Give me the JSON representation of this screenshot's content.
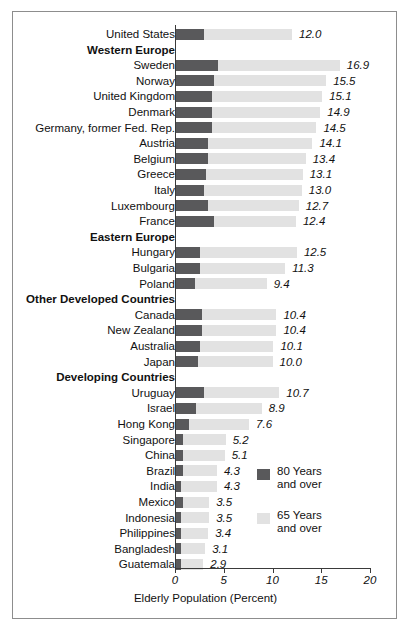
{
  "chart_data": {
    "type": "bar",
    "orientation": "horizontal",
    "stacked": true,
    "title": "",
    "xlabel": "Elderly Population (Percent)",
    "ylabel": "",
    "xlim": [
      0,
      20
    ],
    "xticks": [
      "0",
      "5",
      "10",
      "15",
      "20"
    ],
    "grid": false,
    "legend_position": "inside-right",
    "series": [
      {
        "name": "80 Years and over",
        "color": "#59595b"
      },
      {
        "name": "65 Years and over",
        "color": "#e2e2e2"
      }
    ],
    "rows": [
      {
        "kind": "item",
        "label": "United States",
        "value": 12.0,
        "value_label": "12.0",
        "sub80": 3.0
      },
      {
        "kind": "group",
        "label": "Western Europe",
        "value": null,
        "value_label": "",
        "sub80": null
      },
      {
        "kind": "item",
        "label": "Sweden",
        "value": 16.9,
        "value_label": "16.9",
        "sub80": 4.4
      },
      {
        "kind": "item",
        "label": "Norway",
        "value": 15.5,
        "value_label": "15.5",
        "sub80": 4.0
      },
      {
        "kind": "item",
        "label": "United Kingdom",
        "value": 15.1,
        "value_label": "15.1",
        "sub80": 3.8
      },
      {
        "kind": "item",
        "label": "Denmark",
        "value": 14.9,
        "value_label": "14.9",
        "sub80": 3.8
      },
      {
        "kind": "item",
        "label": "Germany, former Fed. Rep.",
        "value": 14.5,
        "value_label": "14.5",
        "sub80": 3.8
      },
      {
        "kind": "item",
        "label": "Austria",
        "value": 14.1,
        "value_label": "14.1",
        "sub80": 3.4
      },
      {
        "kind": "item",
        "label": "Belgium",
        "value": 13.4,
        "value_label": "13.4",
        "sub80": 3.4
      },
      {
        "kind": "item",
        "label": "Greece",
        "value": 13.1,
        "value_label": "13.1",
        "sub80": 3.2
      },
      {
        "kind": "item",
        "label": "Italy",
        "value": 13.0,
        "value_label": "13.0",
        "sub80": 3.0
      },
      {
        "kind": "item",
        "label": "Luxembourg",
        "value": 12.7,
        "value_label": "12.7",
        "sub80": 3.4
      },
      {
        "kind": "item",
        "label": "France",
        "value": 12.4,
        "value_label": "12.4",
        "sub80": 4.0
      },
      {
        "kind": "group",
        "label": "Eastern Europe",
        "value": null,
        "value_label": "",
        "sub80": null
      },
      {
        "kind": "item",
        "label": "Hungary",
        "value": 12.5,
        "value_label": "12.5",
        "sub80": 2.6
      },
      {
        "kind": "item",
        "label": "Bulgaria",
        "value": 11.3,
        "value_label": "11.3",
        "sub80": 2.6
      },
      {
        "kind": "item",
        "label": "Poland",
        "value": 9.4,
        "value_label": "9.4",
        "sub80": 2.0
      },
      {
        "kind": "group",
        "label": "Other Developed Countries",
        "value": null,
        "value_label": "",
        "sub80": null
      },
      {
        "kind": "item",
        "label": "Canada",
        "value": 10.4,
        "value_label": "10.4",
        "sub80": 2.8
      },
      {
        "kind": "item",
        "label": "New Zealand",
        "value": 10.4,
        "value_label": "10.4",
        "sub80": 2.8
      },
      {
        "kind": "item",
        "label": "Australia",
        "value": 10.1,
        "value_label": "10.1",
        "sub80": 2.6
      },
      {
        "kind": "item",
        "label": "Japan",
        "value": 10.0,
        "value_label": "10.0",
        "sub80": 2.4
      },
      {
        "kind": "group",
        "label": "Developing Countries",
        "value": null,
        "value_label": "",
        "sub80": null
      },
      {
        "kind": "item",
        "label": "Uruguay",
        "value": 10.7,
        "value_label": "10.7",
        "sub80": 3.0
      },
      {
        "kind": "item",
        "label": "Israel",
        "value": 8.9,
        "value_label": "8.9",
        "sub80": 2.2
      },
      {
        "kind": "item",
        "label": "Hong Kong",
        "value": 7.6,
        "value_label": "7.6",
        "sub80": 1.4
      },
      {
        "kind": "item",
        "label": "Singapore",
        "value": 5.2,
        "value_label": "5.2",
        "sub80": 0.8
      },
      {
        "kind": "item",
        "label": "China",
        "value": 5.1,
        "value_label": "5.1",
        "sub80": 0.8
      },
      {
        "kind": "item",
        "label": "Brazil",
        "value": 4.3,
        "value_label": "4.3",
        "sub80": 0.8
      },
      {
        "kind": "item",
        "label": "India",
        "value": 4.3,
        "value_label": "4.3",
        "sub80": 0.6
      },
      {
        "kind": "item",
        "label": "Mexico",
        "value": 3.5,
        "value_label": "3.5",
        "sub80": 0.8
      },
      {
        "kind": "item",
        "label": "Indonesia",
        "value": 3.5,
        "value_label": "3.5",
        "sub80": 0.6
      },
      {
        "kind": "item",
        "label": "Philippines",
        "value": 3.4,
        "value_label": "3.4",
        "sub80": 0.6
      },
      {
        "kind": "item",
        "label": "Bangladesh",
        "value": 3.1,
        "value_label": "3.1",
        "sub80": 0.6
      },
      {
        "kind": "item",
        "label": "Guatemala",
        "value": 2.9,
        "value_label": "2.9",
        "sub80": 0.6
      }
    ]
  },
  "axis": {
    "title": "Elderly Population (Percent)",
    "ticks": [
      "0",
      "5",
      "10",
      "15",
      "20"
    ]
  },
  "legend": {
    "items": [
      {
        "label": "80 Years\nand over",
        "swatch": "dark",
        "color": "#59595b"
      },
      {
        "label": "65 Years\nand over",
        "swatch": "light",
        "color": "#e2e2e2"
      }
    ]
  }
}
